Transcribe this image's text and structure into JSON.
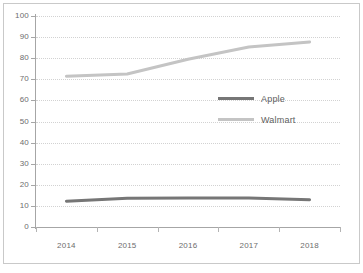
{
  "chart_data": {
    "type": "line",
    "title": "",
    "xlabel": "",
    "ylabel": "",
    "categories": [
      "2014",
      "2015",
      "2016",
      "2017",
      "2018"
    ],
    "ylim": [
      0,
      100
    ],
    "yticks": [
      0,
      10,
      20,
      30,
      40,
      50,
      60,
      70,
      80,
      90,
      100
    ],
    "ytick_labels": [
      "0",
      "10",
      "20",
      "30",
      "40",
      "50",
      "60",
      "70",
      "80",
      "90",
      "100"
    ],
    "grid": true,
    "legend_position": "center-right",
    "series": [
      {
        "name": "Apple",
        "color": "#767676",
        "values": [
          12.2,
          13.6,
          13.7,
          13.7,
          12.9
        ]
      },
      {
        "name": "Walmart",
        "color": "#c4c4c4",
        "values": [
          71.5,
          72.5,
          79.5,
          85.3,
          87.7
        ]
      }
    ]
  },
  "legend": {
    "items": [
      {
        "label": "Apple",
        "color": "#767676"
      },
      {
        "label": "Walmart",
        "color": "#c4c4c4"
      }
    ]
  },
  "colors": {
    "apple": "#767676",
    "walmart": "#c4c4c4",
    "axis": "#a6a6a6",
    "grid": "#d2d2d2",
    "border": "#c9c9c9",
    "text": "#6d6d6d"
  }
}
